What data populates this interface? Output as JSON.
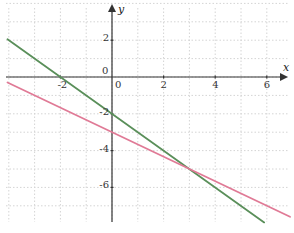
{
  "chart_data": {
    "type": "line",
    "title": "",
    "xlabel": "x",
    "ylabel": "y",
    "xlim": [
      -4.3,
      6.9
    ],
    "ylim": [
      -7.8,
      4.2
    ],
    "grid": true,
    "grid_step": 1,
    "x_ticks": [
      -2,
      0,
      2,
      4,
      6
    ],
    "x_tick_labels": [
      "-2",
      "0",
      "2",
      "4",
      "6"
    ],
    "y_ticks": [
      2,
      0,
      -2,
      -4,
      -6
    ],
    "y_tick_labels": [
      "2",
      "0",
      "-2",
      "-4",
      "-6"
    ],
    "series": [
      {
        "name": "y = -x - 2",
        "color": "#5a8f5a",
        "x": [
          -4.05,
          5.9
        ],
        "y": [
          2.05,
          -7.9
        ]
      },
      {
        "name": "y = -2/3 x - 3",
        "color": "#e07a96",
        "x": [
          -4.05,
          6.9
        ],
        "y": [
          -0.3,
          -7.6
        ]
      }
    ],
    "annotations": [
      {
        "text": "intersection",
        "x": 3,
        "y": -5
      }
    ]
  },
  "style": {
    "axis_color": "#333333",
    "grid_color": "#d4d4d4",
    "background": "#ffffff"
  }
}
